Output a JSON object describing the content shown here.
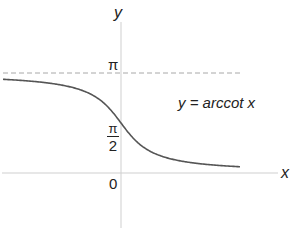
{
  "chart_data": {
    "type": "line",
    "title": "",
    "function": "y = arccot x",
    "xlabel": "x",
    "ylabel": "y",
    "annotation": "y = arccot x",
    "y_tick_labels": [
      "π",
      "π/2",
      "0"
    ],
    "asymptote": {
      "y": "π",
      "style": "dashed"
    },
    "x": [
      -5,
      -4,
      -3,
      -2,
      -1,
      0,
      1,
      2,
      3,
      4,
      5
    ],
    "values": [
      3.0442,
      2.8966,
      2.8198,
      2.6779,
      2.3562,
      1.5708,
      0.7854,
      0.4636,
      0.3218,
      0.245,
      0.1974
    ],
    "grid": false,
    "legend": "none"
  },
  "labels": {
    "y_axis": "y",
    "x_axis": "x",
    "pi": "π",
    "pi_half_num": "π",
    "pi_half_den": "2",
    "zero": "0",
    "equation": "y = arccot x"
  },
  "colors": {
    "curve": "#555555",
    "axis": "#cccccc",
    "asymptote": "#aaaaaa"
  }
}
